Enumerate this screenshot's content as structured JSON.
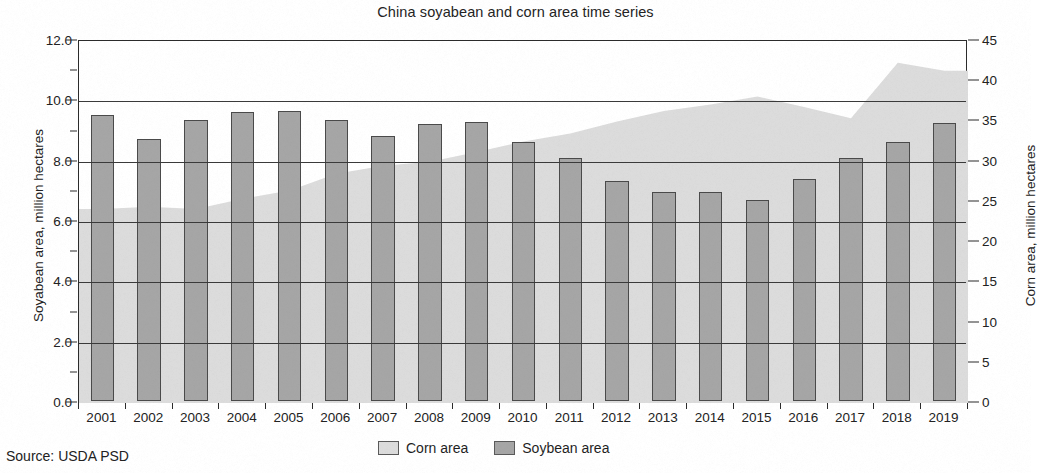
{
  "chart_data": {
    "type": "bar",
    "title": "China soyabean and corn area time series",
    "xlabel": "",
    "ylabel": "Soyabean area, million hectares",
    "y2label": "Corn area, million hectares",
    "ylim": [
      0.0,
      12.0
    ],
    "y2lim": [
      0,
      45
    ],
    "yticks": [
      "0.0",
      "2.0",
      "4.0",
      "6.0",
      "8.0",
      "10.0",
      "12.0"
    ],
    "y2ticks": [
      "0",
      "5",
      "10",
      "15",
      "20",
      "25",
      "30",
      "35",
      "40",
      "45"
    ],
    "grid": "horizontal",
    "legend_position": "bottom-center",
    "categories": [
      "2001",
      "2002",
      "2003",
      "2004",
      "2005",
      "2006",
      "2007",
      "2008",
      "2009",
      "2010",
      "2011",
      "2012",
      "2013",
      "2014",
      "2015",
      "2016",
      "2017",
      "2018",
      "2019"
    ],
    "series": [
      {
        "name": "Corn area",
        "render": "area",
        "axis": "right",
        "units": "million hectares",
        "color": "#dcdcdc",
        "values": [
          24.1,
          24.4,
          24.1,
          25.4,
          26.4,
          28.5,
          29.5,
          30.0,
          31.2,
          32.5,
          33.5,
          35.0,
          36.3,
          37.1,
          38.1,
          36.8,
          35.4,
          42.3,
          41.3
        ]
      },
      {
        "name": "Soybean area",
        "render": "bar",
        "axis": "left",
        "units": "million hectares",
        "color": "#a6a6a6",
        "values": [
          9.48,
          8.68,
          9.32,
          9.58,
          9.62,
          9.31,
          8.78,
          9.17,
          9.25,
          8.58,
          8.05,
          7.3,
          6.93,
          6.93,
          6.65,
          7.36,
          8.05,
          8.58,
          9.2
        ]
      }
    ]
  },
  "footer": {
    "source": "Source: USDA PSD"
  },
  "legend": {
    "items": [
      {
        "label": "Corn area",
        "color": "#dcdcdc"
      },
      {
        "label": "Soybean area",
        "color": "#a6a6a6"
      }
    ]
  }
}
